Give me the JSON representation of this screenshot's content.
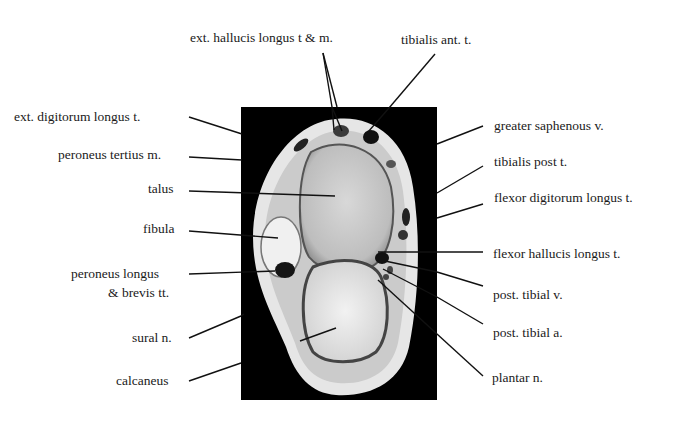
{
  "figure": {
    "type": "axial MRI cross-section of ankle with anatomical labels",
    "left_labels": [
      {
        "text": "ext. digitorum longus t.",
        "x": 14,
        "y": 109
      },
      {
        "text": "peroneus tertius m.",
        "x": 58,
        "y": 147
      },
      {
        "text": "talus",
        "x": 148,
        "y": 181
      },
      {
        "text": "fibula",
        "x": 143,
        "y": 221
      },
      {
        "text": "peroneus longus",
        "x": 71,
        "y": 266
      },
      {
        "text": "& brevis tt.",
        "x": 108,
        "y": 285
      },
      {
        "text": "sural n.",
        "x": 132,
        "y": 330
      },
      {
        "text": "calcaneus",
        "x": 116,
        "y": 373
      }
    ],
    "top_labels": [
      {
        "text": "ext. hallucis longus t & m.",
        "x": 190,
        "y": 30
      },
      {
        "text": "tibialis ant. t.",
        "x": 401,
        "y": 32
      }
    ],
    "right_labels": [
      {
        "text": "greater saphenous v.",
        "x": 494,
        "y": 118
      },
      {
        "text": "tibialis post t.",
        "x": 494,
        "y": 154
      },
      {
        "text": "flexor digitorum longus t.",
        "x": 494,
        "y": 190
      },
      {
        "text": "flexor hallucis longus t.",
        "x": 493,
        "y": 246
      },
      {
        "text": "post. tibial v.",
        "x": 493,
        "y": 287
      },
      {
        "text": "post. tibial a.",
        "x": 493,
        "y": 325
      },
      {
        "text": "plantar n.",
        "x": 492,
        "y": 370
      }
    ]
  }
}
